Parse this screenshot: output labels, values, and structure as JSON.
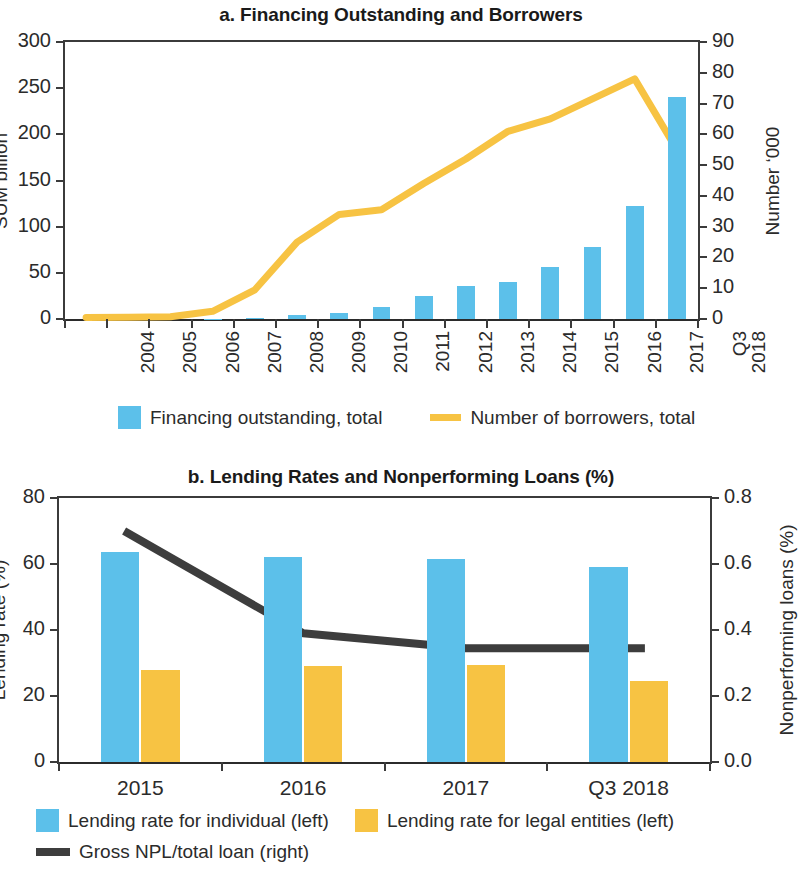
{
  "figure": {
    "background": "#ffffff",
    "bar_blue": "#5cc0ea",
    "bar_yellow": "#f7c343",
    "line_yellow": "#f7c343",
    "line_dark": "#3d3d3d",
    "axis_color": "#3b3b3b"
  },
  "panel_a": {
    "title": "a. Financing  Outstanding and Borrowers",
    "left_axis_title": "SUM billion",
    "right_axis_title": "Number ‘000",
    "left_ticks": [
      "0",
      "50",
      "100",
      "150",
      "200",
      "250",
      "300"
    ],
    "right_ticks": [
      "0",
      "10",
      "20",
      "30",
      "40",
      "50",
      "60",
      "70",
      "80",
      "90"
    ],
    "x_labels": [
      {
        "l1": "2004",
        "l2": ""
      },
      {
        "l1": "2005",
        "l2": ""
      },
      {
        "l1": "2006",
        "l2": ""
      },
      {
        "l1": "2007",
        "l2": ""
      },
      {
        "l1": "2008",
        "l2": ""
      },
      {
        "l1": "2009",
        "l2": ""
      },
      {
        "l1": "2010",
        "l2": ""
      },
      {
        "l1": "2011",
        "l2": ""
      },
      {
        "l1": "2012",
        "l2": ""
      },
      {
        "l1": "2013",
        "l2": ""
      },
      {
        "l1": "2014",
        "l2": ""
      },
      {
        "l1": "2015",
        "l2": ""
      },
      {
        "l1": "2016",
        "l2": ""
      },
      {
        "l1": "2017",
        "l2": ""
      },
      {
        "l1": "Q3",
        "l2": "2018"
      }
    ],
    "legend": [
      {
        "label": "Financing outstanding, total",
        "marker": "square",
        "color": "#5cc0ea"
      },
      {
        "label": "Number of borrowers, total",
        "marker": "line",
        "color": "#f7c343"
      }
    ]
  },
  "panel_b": {
    "title": "b. Lending Rates and Nonperforming Loans (%)",
    "left_axis_title": "Lending rate (%)",
    "right_axis_title": "Nonperforming loans (%)",
    "left_ticks": [
      "0",
      "20",
      "40",
      "60",
      "80"
    ],
    "right_ticks": [
      "0.0",
      "0.2",
      "0.4",
      "0.6",
      "0.8"
    ],
    "x_labels": [
      "2015",
      "2016",
      "2017",
      "Q3 2018"
    ],
    "legend": [
      {
        "label": "Lending rate for individual (left)",
        "marker": "square",
        "color": "#5cc0ea"
      },
      {
        "label": "Lending rate for legal entities (left)",
        "marker": "square",
        "color": "#f7c343"
      },
      {
        "label": "Gross NPL/total loan (right)",
        "marker": "line",
        "color": "#3d3d3d"
      }
    ]
  },
  "chart_data": [
    {
      "type": "bar",
      "id": "panel-a",
      "title": "a. Financing  Outstanding and Borrowers",
      "xlabel": "",
      "ylabel": "SUM billion",
      "y2label": "Number ‘000",
      "ylim": [
        0,
        300
      ],
      "y2lim": [
        0,
        90
      ],
      "yticks": [
        0,
        50,
        100,
        150,
        200,
        250,
        300
      ],
      "y2ticks": [
        0,
        10,
        20,
        30,
        40,
        50,
        60,
        70,
        80,
        90
      ],
      "grid": false,
      "legend_position": "bottom",
      "categories": [
        "2004",
        "2005",
        "2006",
        "2007",
        "2008",
        "2009",
        "2010",
        "2011",
        "2012",
        "2013",
        "2014",
        "2015",
        "2016",
        "2017",
        "Q3 2018"
      ],
      "series": [
        {
          "name": "Financing outstanding, total",
          "type": "bar",
          "axis": "left",
          "color": "#5cc0ea",
          "values": [
            0,
            0,
            0,
            0.5,
            1.5,
            4,
            7,
            13,
            25,
            36,
            40,
            56,
            78,
            122,
            240
          ]
        },
        {
          "name": "Number of borrowers, total",
          "type": "line",
          "axis": "right",
          "color": "#f7c343",
          "values": [
            0.5,
            0.6,
            0.7,
            2.5,
            9.5,
            25,
            34,
            35.5,
            44,
            52,
            61,
            65,
            71.5,
            78,
            55
          ]
        }
      ]
    },
    {
      "type": "bar",
      "id": "panel-b",
      "title": "b. Lending Rates and Nonperforming Loans (%)",
      "xlabel": "",
      "ylabel": "Lending rate (%)",
      "y2label": "Nonperforming loans (%)",
      "ylim": [
        0,
        80
      ],
      "y2lim": [
        0,
        0.8
      ],
      "yticks": [
        0,
        20,
        40,
        60,
        80
      ],
      "y2ticks": [
        0.0,
        0.2,
        0.4,
        0.6,
        0.8
      ],
      "grid": false,
      "legend_position": "bottom",
      "categories": [
        "2015",
        "2016",
        "2017",
        "Q3 2018"
      ],
      "series": [
        {
          "name": "Lending rate for individual (left)",
          "type": "bar",
          "axis": "left",
          "color": "#5cc0ea",
          "values": [
            63.5,
            62,
            61.5,
            59
          ]
        },
        {
          "name": "Lending rate for legal entities (left)",
          "type": "bar",
          "axis": "left",
          "color": "#f7c343",
          "values": [
            28,
            29,
            29.5,
            24.5
          ]
        },
        {
          "name": "Gross NPL/total loan (right)",
          "type": "line",
          "axis": "right",
          "color": "#3d3d3d",
          "values": [
            0.7,
            0.39,
            0.345,
            0.345
          ]
        }
      ]
    }
  ]
}
